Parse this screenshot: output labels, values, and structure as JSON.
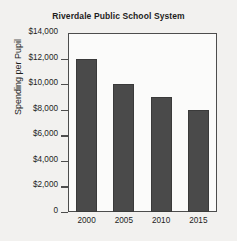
{
  "chart_data": {
    "type": "bar",
    "title": "Riverdale Public School System",
    "xlabel": "",
    "ylabel": "Spending per Pupil",
    "categories": [
      "2000",
      "2005",
      "2010",
      "2015"
    ],
    "values": [
      12000,
      10000,
      9000,
      8000
    ],
    "ylim": [
      0,
      14000
    ],
    "ytick_values": [
      14000,
      12000,
      10000,
      8000,
      6000,
      4000,
      2000,
      0
    ],
    "ytick_labels": [
      "$14,000",
      "$12,000",
      "$10,000",
      "$8,000",
      "$6,000",
      "$4,000",
      "$2,000",
      "0"
    ],
    "grid": false,
    "legend": null,
    "series": [
      {
        "name": "Spending per Pupil",
        "values": [
          12000,
          10000,
          9000,
          8000
        ]
      }
    ],
    "bar_color": "#4a4a4a",
    "background_color": "#f2f1ef",
    "axis_color": "#4d4d4d"
  }
}
